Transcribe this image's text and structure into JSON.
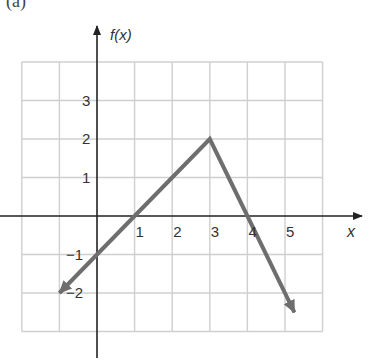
{
  "panel_label": "(a)",
  "chart_data": {
    "type": "line",
    "title": "",
    "xlabel": "x",
    "ylabel": "f(x)",
    "xlim": [
      -2,
      6
    ],
    "ylim": [
      -3,
      4
    ],
    "grid": true,
    "x_ticks": [
      "1",
      "2",
      "3",
      "4",
      "5"
    ],
    "y_ticks": [
      "3",
      "2",
      "1",
      "-1",
      "-2"
    ],
    "series": [
      {
        "name": "f(x)",
        "color": "#6e6e6e",
        "points": [
          [
            -1,
            -2
          ],
          [
            0,
            -1
          ],
          [
            1,
            0
          ],
          [
            3,
            2
          ],
          [
            4,
            0
          ],
          [
            5.25,
            -2.5
          ]
        ],
        "arrow_start": true,
        "arrow_end": true
      }
    ]
  },
  "colors": {
    "axis": "#222222",
    "grid": "#cfcfcf",
    "line": "#6e6e6e"
  }
}
